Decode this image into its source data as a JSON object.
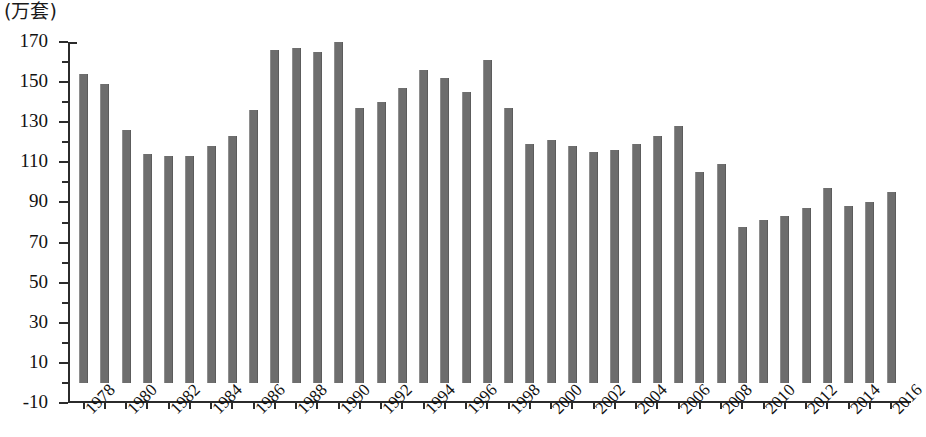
{
  "chart_data": {
    "type": "bar",
    "title": "",
    "subtitle": "",
    "unit_label": "(万套)",
    "xlabel": "",
    "ylabel": "",
    "ylim": [
      -10,
      170
    ],
    "y_tick_step": 20,
    "y_ticks": [
      -10,
      10,
      30,
      50,
      70,
      90,
      110,
      130,
      150,
      170
    ],
    "y_minor_tick_step": 10,
    "grid": false,
    "legend": "none",
    "bar_color": "#6e6e6e",
    "axis_color": "#2b2b2b",
    "x_tick_label_step": 2,
    "x_tick_labels": [
      "1978",
      "1980",
      "1982",
      "1984",
      "1986",
      "1988",
      "1990",
      "1992",
      "1994",
      "1996",
      "1998",
      "2000",
      "2002",
      "2004",
      "2006",
      "2008",
      "2010",
      "2012",
      "2014",
      "2016"
    ],
    "categories": [
      "1978",
      "1979",
      "1980",
      "1981",
      "1982",
      "1983",
      "1984",
      "1985",
      "1986",
      "1987",
      "1988",
      "1989",
      "1990",
      "1991",
      "1992",
      "1993",
      "1994",
      "1995",
      "1996",
      "1997",
      "1998",
      "1999",
      "2000",
      "2001",
      "2002",
      "2003",
      "2004",
      "2005",
      "2006",
      "2007",
      "2008",
      "2009",
      "2010",
      "2011",
      "2012",
      "2013",
      "2014",
      "2015",
      "2016"
    ],
    "values": [
      154,
      149,
      126,
      114,
      113,
      113,
      118,
      123,
      136,
      166,
      167,
      165,
      170,
      137,
      140,
      147,
      156,
      152,
      145,
      161,
      137,
      119,
      121,
      118,
      115,
      116,
      119,
      123,
      128,
      105,
      109,
      78,
      81,
      83,
      87,
      97,
      88,
      90,
      95
    ]
  }
}
